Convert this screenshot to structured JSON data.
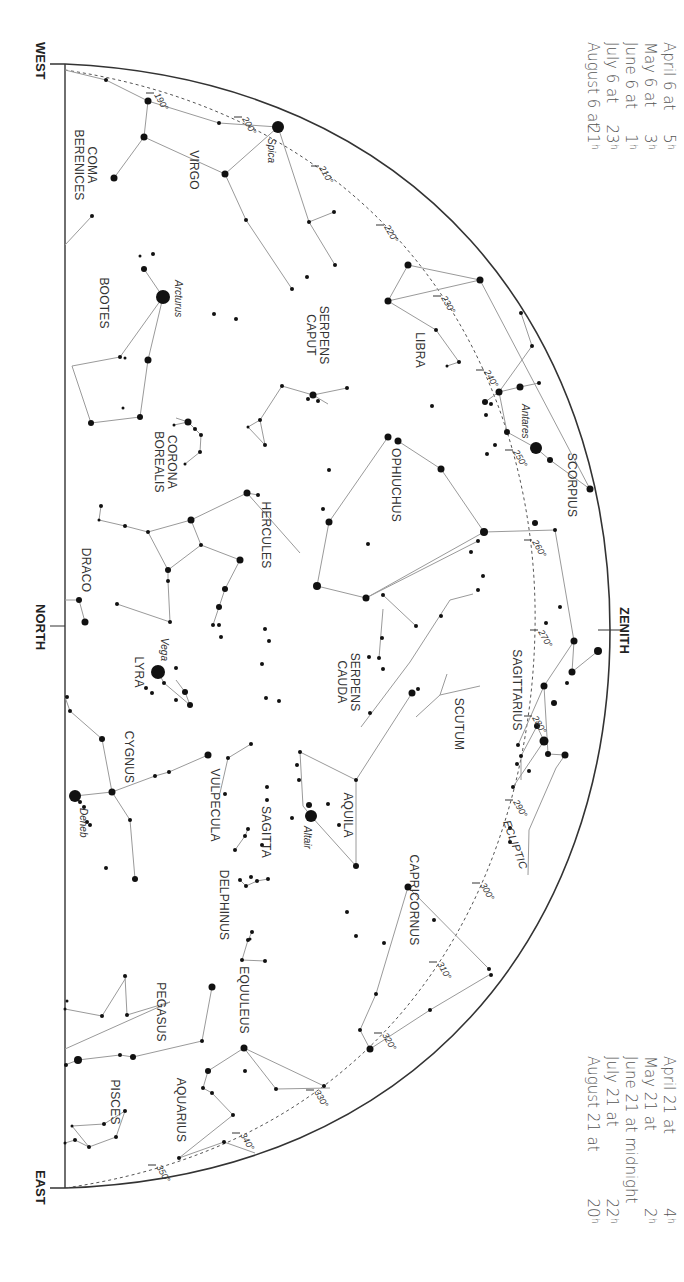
{
  "directions": {
    "west": "WEST",
    "north": "NORTH",
    "east": "EAST",
    "zenith": "ZENITH"
  },
  "ecliptic_label": "ECLIPTIC",
  "times_top": [
    {
      "date": "April 6 at",
      "hour": "5",
      "unit": "h"
    },
    {
      "date": "May 6 at",
      "hour": "3",
      "unit": "h"
    },
    {
      "date": "June 6 at",
      "hour": "1",
      "unit": "h"
    },
    {
      "date": "July 6 at",
      "hour": "23",
      "unit": "h"
    },
    {
      "date": "August 6 at",
      "hour": "21",
      "unit": "h"
    }
  ],
  "times_bottom": [
    {
      "date": "April 21 at",
      "hour": "4",
      "unit": "h"
    },
    {
      "date": "May 21 at",
      "hour": "2",
      "unit": "h"
    },
    {
      "date": "June 21 at midnight",
      "hour": "",
      "unit": ""
    },
    {
      "date": "July 21 at",
      "hour": "22",
      "unit": "h"
    },
    {
      "date": "August 21 at",
      "hour": "20",
      "unit": "h"
    }
  ],
  "ecliptic_degrees": [
    {
      "label": "190°",
      "x": 150,
      "y": 93
    },
    {
      "label": "200°",
      "x": 238,
      "y": 117
    },
    {
      "label": "210°",
      "x": 315,
      "y": 166
    },
    {
      "label": "220°",
      "x": 380,
      "y": 225
    },
    {
      "label": "230°",
      "x": 437,
      "y": 296
    },
    {
      "label": "240°",
      "x": 480,
      "y": 370
    },
    {
      "label": "250°",
      "x": 509,
      "y": 450
    },
    {
      "label": "260°",
      "x": 528,
      "y": 540
    },
    {
      "label": "270°",
      "x": 534,
      "y": 630
    },
    {
      "label": "280°",
      "x": 528,
      "y": 716
    },
    {
      "label": "290°",
      "x": 509,
      "y": 800
    },
    {
      "label": "300°",
      "x": 476,
      "y": 883
    },
    {
      "label": "310°",
      "x": 433,
      "y": 962
    },
    {
      "label": "320°",
      "x": 378,
      "y": 1033
    },
    {
      "label": "330°",
      "x": 310,
      "y": 1090
    },
    {
      "label": "340°",
      "x": 236,
      "y": 1133
    },
    {
      "label": "350°",
      "x": 152,
      "y": 1165
    }
  ],
  "constellations": [
    {
      "name": "COMA BERENICES",
      "lines": [
        "COMA",
        "BERENICES"
      ],
      "x": 88,
      "y": 165
    },
    {
      "name": "VIRGO",
      "lines": [
        "VIRGO"
      ],
      "x": 190,
      "y": 170
    },
    {
      "name": "BOOTES",
      "lines": [
        "BOOTES"
      ],
      "x": 100,
      "y": 303
    },
    {
      "name": "SERPENS CAPUT",
      "lines": [
        "SERPENS",
        "CAPUT"
      ],
      "x": 320,
      "y": 335
    },
    {
      "name": "LIBRA",
      "lines": [
        "LIBRA"
      ],
      "x": 416,
      "y": 350
    },
    {
      "name": "CORONA BOREALIS",
      "lines": [
        "CORONA",
        "BOREALIS"
      ],
      "x": 168,
      "y": 462
    },
    {
      "name": "SCORPIUS",
      "lines": [
        "SCORPIUS"
      ],
      "x": 568,
      "y": 485
    },
    {
      "name": "OPHIUCHUS",
      "lines": [
        "OPHIUCHUS"
      ],
      "x": 392,
      "y": 485
    },
    {
      "name": "HERCULES",
      "lines": [
        "HERCULES"
      ],
      "x": 262,
      "y": 535
    },
    {
      "name": "DRACO",
      "lines": [
        "DRACO"
      ],
      "x": 82,
      "y": 570
    },
    {
      "name": "SERPENS CAUDA",
      "lines": [
        "SERPENS",
        "CAUDA"
      ],
      "x": 351,
      "y": 682
    },
    {
      "name": "SAGITTARIUS",
      "lines": [
        "SAGITTARIUS"
      ],
      "x": 513,
      "y": 690
    },
    {
      "name": "LYRA",
      "lines": [
        "LYRA"
      ],
      "x": 135,
      "y": 672
    },
    {
      "name": "SCUTUM",
      "lines": [
        "SCUTUM"
      ],
      "x": 455,
      "y": 724
    },
    {
      "name": "CYGNUS",
      "lines": [
        "CYGNUS"
      ],
      "x": 125,
      "y": 757
    },
    {
      "name": "AQUILA",
      "lines": [
        "AQUILA"
      ],
      "x": 344,
      "y": 815
    },
    {
      "name": "VULPECULA",
      "lines": [
        "VULPECULA"
      ],
      "x": 211,
      "y": 805
    },
    {
      "name": "SAGITTA",
      "lines": [
        "SAGITTA"
      ],
      "x": 262,
      "y": 832
    },
    {
      "name": "DELPHINUS",
      "lines": [
        "DELPHINUS"
      ],
      "x": 220,
      "y": 905
    },
    {
      "name": "CAPRICORNUS",
      "lines": [
        "CAPRICORNUS"
      ],
      "x": 410,
      "y": 900
    },
    {
      "name": "EQUULEUS",
      "lines": [
        "EQUULEUS"
      ],
      "x": 240,
      "y": 1000
    },
    {
      "name": "PEGASUS",
      "lines": [
        "PEGASUS"
      ],
      "x": 157,
      "y": 1012
    },
    {
      "name": "AQUARIUS",
      "lines": [
        "AQUARIUS"
      ],
      "x": 177,
      "y": 1110
    },
    {
      "name": "PISCES",
      "lines": [
        "PISCES"
      ],
      "x": 111,
      "y": 1102
    }
  ],
  "named_stars": [
    {
      "name": "Spica",
      "x": 278,
      "y": 127,
      "r": 6,
      "lx": 268,
      "ly": 138
    },
    {
      "name": "Arcturus",
      "x": 163,
      "y": 297,
      "r": 7,
      "lx": 175,
      "ly": 280
    },
    {
      "name": "Antares",
      "x": 536,
      "y": 448,
      "r": 6,
      "lx": 522,
      "ly": 404
    },
    {
      "name": "Vega",
      "x": 158,
      "y": 672,
      "r": 7,
      "lx": 161,
      "ly": 638
    },
    {
      "name": "Altair",
      "x": 311,
      "y": 816,
      "r": 6,
      "lx": 304,
      "ly": 826
    },
    {
      "name": "Deneb",
      "x": 75,
      "y": 796,
      "r": 6,
      "lx": 80,
      "ly": 808
    }
  ],
  "stars": [
    [
      106,
      80,
      2
    ],
    [
      148,
      101,
      3.5
    ],
    [
      144,
      137,
      3.5
    ],
    [
      219,
      123,
      2
    ],
    [
      225,
      174,
      3.5
    ],
    [
      114,
      178,
      3.5
    ],
    [
      92,
      216,
      2
    ],
    [
      246,
      220,
      2
    ],
    [
      292,
      289,
      2
    ],
    [
      309,
      222,
      2
    ],
    [
      334,
      212,
      2
    ],
    [
      335,
      265,
      2
    ],
    [
      408,
      265,
      3.5
    ],
    [
      480,
      280,
      3.5
    ],
    [
      388,
      301,
      3.5
    ],
    [
      436,
      330,
      2
    ],
    [
      459,
      362,
      2
    ],
    [
      447,
      366,
      1.5
    ],
    [
      432,
      406,
      2
    ],
    [
      521,
      313,
      2
    ],
    [
      532,
      346,
      2
    ],
    [
      499,
      392,
      3.5
    ],
    [
      520,
      387,
      3.5
    ],
    [
      539,
      383,
      2
    ],
    [
      485,
      402,
      3
    ],
    [
      491,
      404,
      2
    ],
    [
      486,
      415,
      2
    ],
    [
      495,
      445,
      2
    ],
    [
      487,
      454,
      2
    ],
    [
      507,
      432,
      3
    ],
    [
      550,
      460,
      3
    ],
    [
      590,
      489,
      3.5
    ],
    [
      153,
      254,
      2
    ],
    [
      140,
      256,
      1.5
    ],
    [
      144,
      269,
      3
    ],
    [
      148,
      360,
      3.5
    ],
    [
      120,
      357,
      2
    ],
    [
      125,
      358,
      1.5
    ],
    [
      91,
      423,
      3
    ],
    [
      123,
      408,
      1.5
    ],
    [
      140,
      417,
      3
    ],
    [
      174,
      425,
      1.5
    ],
    [
      188,
      422,
      3.5
    ],
    [
      195,
      429,
      2
    ],
    [
      201,
      435,
      2
    ],
    [
      200,
      452,
      2
    ],
    [
      185,
      464,
      1.5
    ],
    [
      214,
      314,
      2
    ],
    [
      236,
      319,
      2
    ],
    [
      307,
      277,
      2
    ],
    [
      282,
      386,
      2
    ],
    [
      260,
      420,
      2
    ],
    [
      248,
      427,
      1.5
    ],
    [
      265,
      445,
      2
    ],
    [
      313,
      395,
      3.5
    ],
    [
      308,
      399,
      2
    ],
    [
      318,
      401,
      2
    ],
    [
      347,
      388,
      2
    ],
    [
      388,
      437,
      3.5
    ],
    [
      398,
      441,
      3.5
    ],
    [
      441,
      469,
      3.5
    ],
    [
      329,
      470,
      2
    ],
    [
      323,
      509,
      2
    ],
    [
      329,
      522,
      3.5
    ],
    [
      484,
      532,
      4
    ],
    [
      317,
      586,
      4
    ],
    [
      366,
      598,
      3.5
    ],
    [
      368,
      544,
      2
    ],
    [
      471,
      552,
      2
    ],
    [
      478,
      590,
      2
    ],
    [
      441,
      616,
      2
    ],
    [
      247,
      493,
      3.5
    ],
    [
      258,
      495,
      2
    ],
    [
      191,
      520,
      3.5
    ],
    [
      101,
      506,
      2
    ],
    [
      99,
      520,
      1.5
    ],
    [
      125,
      526,
      2
    ],
    [
      148,
      532,
      2
    ],
    [
      168,
      570,
      3
    ],
    [
      168,
      581,
      2
    ],
    [
      201,
      545,
      2
    ],
    [
      240,
      560,
      3.5
    ],
    [
      225,
      589,
      3
    ],
    [
      219,
      607,
      3
    ],
    [
      213,
      625,
      2
    ],
    [
      219,
      625,
      2
    ],
    [
      221,
      637,
      2
    ],
    [
      265,
      629,
      2
    ],
    [
      269,
      641,
      2
    ],
    [
      262,
      664,
      2
    ],
    [
      266,
      698,
      2
    ],
    [
      279,
      701,
      2
    ],
    [
      117,
      604,
      2
    ],
    [
      170,
      622,
      2
    ],
    [
      176,
      668,
      2
    ],
    [
      164,
      683,
      2
    ],
    [
      185,
      692,
      3
    ],
    [
      190,
      705,
      3
    ],
    [
      176,
      700,
      2
    ],
    [
      146,
      688,
      2
    ],
    [
      152,
      693,
      2
    ],
    [
      79,
      600,
      3
    ],
    [
      85,
      622,
      3.5
    ],
    [
      67,
      697,
      2
    ],
    [
      70,
      711,
      2
    ],
    [
      102,
      739,
      3
    ],
    [
      112,
      792,
      3.5
    ],
    [
      155,
      776,
      2
    ],
    [
      169,
      772,
      2
    ],
    [
      208,
      755,
      3.5
    ],
    [
      228,
      758,
      2
    ],
    [
      251,
      744,
      2
    ],
    [
      225,
      794,
      2
    ],
    [
      248,
      829,
      2
    ],
    [
      245,
      836,
      2
    ],
    [
      235,
      850,
      2
    ],
    [
      262,
      845,
      2
    ],
    [
      267,
      800,
      2
    ],
    [
      267,
      787,
      2
    ],
    [
      130,
      820,
      2
    ],
    [
      135,
      879,
      3
    ],
    [
      87,
      822,
      2
    ],
    [
      90,
      825,
      2
    ],
    [
      106,
      868,
      2
    ],
    [
      80,
      802,
      2
    ],
    [
      84,
      807,
      2
    ],
    [
      300,
      752,
      2
    ],
    [
      299,
      780,
      2
    ],
    [
      297,
      765,
      2
    ],
    [
      328,
      804,
      2
    ],
    [
      356,
      780,
      2
    ],
    [
      339,
      825,
      2
    ],
    [
      356,
      866,
      3
    ],
    [
      292,
      818,
      2
    ],
    [
      309,
      805,
      3
    ],
    [
      412,
      693,
      3.5
    ],
    [
      418,
      689,
      2
    ],
    [
      370,
      713,
      2
    ],
    [
      383,
      595,
      2
    ],
    [
      382,
      638,
      2
    ],
    [
      379,
      658,
      2
    ],
    [
      383,
      669,
      2
    ],
    [
      369,
      657,
      2
    ],
    [
      416,
      626,
      2
    ],
    [
      478,
      541,
      2
    ],
    [
      483,
      576,
      2
    ],
    [
      546,
      623,
      2
    ],
    [
      555,
      530,
      2
    ],
    [
      535,
      523,
      3
    ],
    [
      560,
      607,
      2
    ],
    [
      574,
      641,
      3.5
    ],
    [
      572,
      672,
      3.5
    ],
    [
      598,
      651,
      4
    ],
    [
      544,
      686,
      3.5
    ],
    [
      567,
      683,
      2
    ],
    [
      554,
      703,
      3
    ],
    [
      518,
      745,
      2
    ],
    [
      537,
      726,
      3
    ],
    [
      521,
      756,
      2
    ],
    [
      529,
      771,
      2
    ],
    [
      517,
      764,
      2
    ],
    [
      544,
      741,
      4.5
    ],
    [
      548,
      754,
      3
    ],
    [
      565,
      755,
      3.5
    ],
    [
      513,
      787,
      2
    ],
    [
      510,
      828,
      2
    ],
    [
      510,
      842,
      2
    ],
    [
      347,
      912,
      2
    ],
    [
      356,
      936,
      2
    ],
    [
      408,
      887,
      3.5
    ],
    [
      434,
      920,
      2
    ],
    [
      489,
      969,
      2
    ],
    [
      491,
      975,
      2
    ],
    [
      384,
      943,
      2
    ],
    [
      376,
      994,
      2
    ],
    [
      360,
      1030,
      2
    ],
    [
      370,
      1049,
      3.5
    ],
    [
      430,
      1010,
      2
    ],
    [
      251,
      877,
      2
    ],
    [
      257,
      881,
      2
    ],
    [
      240,
      880,
      2
    ],
    [
      246,
      886,
      2
    ],
    [
      268,
      879,
      2
    ],
    [
      248,
      940,
      2
    ],
    [
      250,
      939,
      1.5
    ],
    [
      252,
      932,
      2
    ],
    [
      265,
      961,
      2
    ],
    [
      242,
      960,
      2
    ],
    [
      212,
      987,
      3.5
    ],
    [
      202,
      1041,
      2
    ],
    [
      127,
      1015,
      2
    ],
    [
      125,
      976,
      2
    ],
    [
      102,
      1016,
      2
    ],
    [
      65,
      1009,
      1.5
    ],
    [
      67,
      1001,
      1.5
    ],
    [
      66,
      1065,
      2
    ],
    [
      120,
      1055,
      2
    ],
    [
      78,
      1060,
      4
    ],
    [
      133,
      1057,
      3
    ],
    [
      244,
      1048,
      3.5
    ],
    [
      208,
      1071,
      3
    ],
    [
      203,
      1088,
      2
    ],
    [
      212,
      1093,
      2
    ],
    [
      233,
      1115,
      2
    ],
    [
      245,
      1071,
      2
    ],
    [
      276,
      1089,
      2
    ],
    [
      324,
      1086,
      2
    ],
    [
      179,
      1158,
      2
    ],
    [
      224,
      1142,
      2
    ],
    [
      89,
      1147,
      2
    ],
    [
      104,
      1124,
      2
    ],
    [
      125,
      1111,
      2
    ],
    [
      116,
      1137,
      2
    ],
    [
      75,
      1140,
      2
    ],
    [
      65,
      1143,
      1.5
    ],
    [
      72,
      1126,
      1.5
    ]
  ]
}
